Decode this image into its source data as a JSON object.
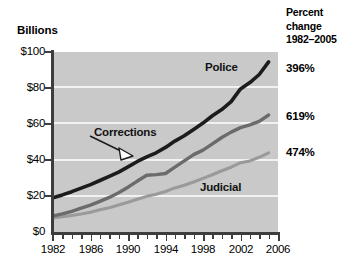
{
  "titles": {
    "y_axis_title": "Billions",
    "percent_header_line1": "Percent",
    "percent_header_line2": "change",
    "percent_header_line3": "1982–2005"
  },
  "axes": {
    "y_ticks": [
      "$0",
      "$20",
      "$40",
      "$60",
      "$80",
      "$100"
    ],
    "x_ticks": [
      "1982",
      "1986",
      "1990",
      "1994",
      "1998",
      "2002",
      "2006"
    ]
  },
  "series_labels": {
    "police": "Police",
    "corrections": "Corrections",
    "judicial": "Judicial"
  },
  "percent_change": {
    "police": "396%",
    "corrections": "619%",
    "judicial": "474%"
  },
  "colors": {
    "police_line": "#1c1c1c",
    "corrections_line": "#6b6b6b",
    "judicial_line": "#9a9a9a",
    "plot_background": "#c9c9c9",
    "gridline": "#f2f2f2",
    "axis": "#3d3d3d",
    "text": "#000000"
  },
  "chart_data": {
    "type": "line",
    "title": "Billions",
    "subtitle": "",
    "xlabel": "",
    "ylabel": "Billions",
    "xlim": [
      1982,
      2006
    ],
    "ylim": [
      0,
      100
    ],
    "grid": true,
    "legend": "inline labels",
    "x": [
      1982,
      1983,
      1984,
      1985,
      1986,
      1987,
      1988,
      1989,
      1990,
      1991,
      1992,
      1993,
      1994,
      1995,
      1996,
      1997,
      1998,
      1999,
      2000,
      2001,
      2002,
      2003,
      2004,
      2005
    ],
    "series": [
      {
        "name": "Police",
        "color": "#1c1c1c",
        "percent_change_1982_2005": "396%",
        "values": [
          19.0,
          20.6,
          22.4,
          24.4,
          26.3,
          28.6,
          30.9,
          33.3,
          36.2,
          39.2,
          41.7,
          44.0,
          47.0,
          50.5,
          53.5,
          57.0,
          60.5,
          64.6,
          68.0,
          72.4,
          79.5,
          83.0,
          87.5,
          94.5
        ]
      },
      {
        "name": "Corrections",
        "color": "#6b6b6b",
        "percent_change_1982_2005": "619%",
        "values": [
          9.0,
          10.1,
          11.5,
          13.2,
          14.9,
          17.0,
          19.2,
          21.8,
          24.9,
          28.3,
          31.5,
          31.9,
          32.5,
          36.0,
          39.5,
          43.0,
          45.5,
          49.0,
          52.5,
          55.5,
          58.0,
          59.5,
          61.5,
          65.0
        ]
      },
      {
        "name": "Judicial",
        "color": "#9a9a9a",
        "percent_change_1982_2005": "474%",
        "values": [
          7.8,
          8.5,
          9.2,
          10.0,
          11.0,
          12.3,
          13.5,
          15.0,
          16.5,
          18.2,
          19.8,
          21.0,
          22.5,
          24.5,
          26.0,
          27.8,
          29.8,
          31.8,
          34.0,
          36.0,
          38.5,
          39.5,
          41.5,
          44.0
        ]
      }
    ]
  }
}
